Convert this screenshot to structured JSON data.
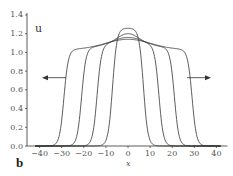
{
  "chart_data": {
    "type": "line",
    "title": "",
    "panel_label": "b",
    "xlabel": "x",
    "ylabel": "u",
    "xlim": [
      -45,
      45
    ],
    "ylim": [
      0,
      1.4
    ],
    "xticks": [
      -40,
      -30,
      -20,
      -10,
      0,
      10,
      20,
      30,
      40
    ],
    "yticks": [
      "0.0",
      "0.2",
      "0.4",
      "0.6",
      "0.8",
      "1.0",
      "1.2",
      "1.4"
    ],
    "grid": false,
    "legend": null,
    "series": [
      {
        "name": "t1",
        "half_width": 7,
        "peak": 1.26,
        "plateau": 1.26,
        "steepness": 2.0
      },
      {
        "name": "t2",
        "half_width": 14,
        "peak": 1.2,
        "plateau": 1.08,
        "steepness": 2.0
      },
      {
        "name": "t3",
        "half_width": 21,
        "peak": 1.16,
        "plateau": 1.05,
        "steepness": 2.0
      },
      {
        "name": "t4",
        "half_width": 29,
        "peak": 1.14,
        "plateau": 1.03,
        "steepness": 2.0
      }
    ],
    "annotations": [
      {
        "type": "arrow",
        "direction": "left",
        "y": 0.73
      },
      {
        "type": "arrow",
        "direction": "right",
        "y": 0.73
      }
    ],
    "color": "#333333"
  }
}
